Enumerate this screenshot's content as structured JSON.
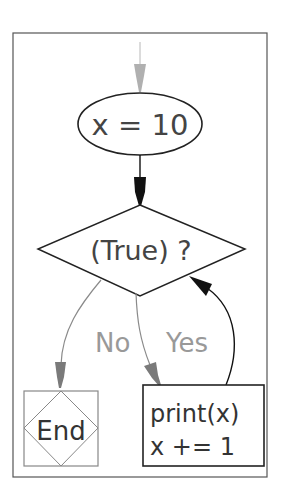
{
  "diagram": {
    "type": "flowchart",
    "nodes": {
      "assign": {
        "label": "x = 10",
        "shape": "ellipse"
      },
      "condition": {
        "label": "(True) ?",
        "shape": "diamond"
      },
      "end": {
        "label": "End",
        "shape": "terminator-box"
      },
      "body": {
        "line1": "print(x)",
        "line2": "x += 1",
        "shape": "rectangle"
      }
    },
    "edges": [
      {
        "from": "start",
        "to": "assign",
        "color": "#b0b0b0"
      },
      {
        "from": "assign",
        "to": "condition",
        "color": "#111111"
      },
      {
        "from": "condition",
        "to": "end",
        "label": "No",
        "color": "#8a8a8a"
      },
      {
        "from": "condition",
        "to": "body",
        "label": "Yes",
        "color": "#8a8a8a"
      },
      {
        "from": "body",
        "to": "condition",
        "color": "#111111"
      }
    ],
    "edge_labels": {
      "no": "No",
      "yes": "Yes"
    },
    "colors": {
      "frame": "#555555",
      "node_stroke": "#222222",
      "end_stroke": "#888888",
      "text": "#333333",
      "label_text": "#999999"
    }
  }
}
